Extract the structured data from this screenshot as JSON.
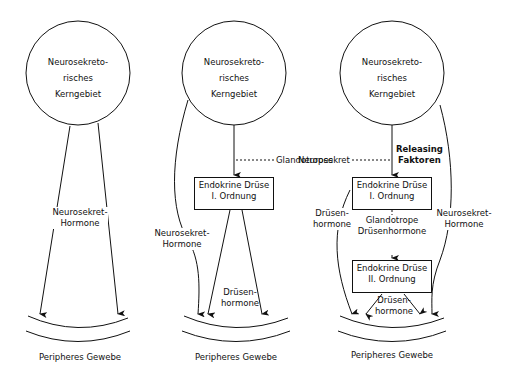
{
  "panels": [
    {
      "nucleus": {
        "line1": "Neurosekreto-",
        "line2": "risches",
        "line3": "Kerngebiet"
      },
      "hormone_label": {
        "line1": "Neurosekret-",
        "line2": "Hormone"
      },
      "tissue": "Peripheres Gewebe"
    },
    {
      "nucleus": {
        "line1": "Neurosekreto-",
        "line2": "risches",
        "line3": "Kerngebiet"
      },
      "glandotropes": "Glandotropes",
      "gland1": {
        "line1": "Endokrine Drüse",
        "line2": "I. Ordnung"
      },
      "neuro_label": {
        "line1": "Neurosekret-",
        "line2": "Hormone"
      },
      "gland_hormone_label": {
        "line1": "Drüsen-",
        "line2": "hormone"
      },
      "tissue": "Peripheres Gewebe"
    },
    {
      "nucleus": {
        "line1": "Neurosekreto-",
        "line2": "risches",
        "line3": "Kerngebiet"
      },
      "neurosekret": "Neurosekret",
      "releasing": {
        "line1": "Releasing",
        "line2": "Faktoren"
      },
      "gland1": {
        "line1": "Endokrine Drüse",
        "line2": "I. Ordnung"
      },
      "glandotrope": {
        "line1": "Glandotrope",
        "line2": "Drüsenhormone"
      },
      "left_label": {
        "line1": "Drüsen-",
        "line2": "hormone"
      },
      "right_label": {
        "line1": "Neurosekret-",
        "line2": "Hormone"
      },
      "gland2": {
        "line1": "Endokrine Drüse",
        "line2": "II. Ordnung"
      },
      "gland2_label": {
        "line1": "Drüsen-",
        "line2": "hormone"
      },
      "tissue": "Peripheres Gewebe"
    }
  ]
}
